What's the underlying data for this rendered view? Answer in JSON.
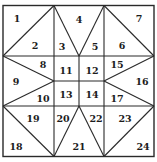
{
  "diagram": {
    "colors": {
      "line": "#2a2a2a",
      "text": "#1c1c1c",
      "background": "#ffffff"
    },
    "pieces": [
      {
        "id": "1",
        "x": 17,
        "y": 18
      },
      {
        "id": "2",
        "x": 35,
        "y": 45
      },
      {
        "id": "3",
        "x": 62,
        "y": 46
      },
      {
        "id": "4",
        "x": 79,
        "y": 19
      },
      {
        "id": "5",
        "x": 95,
        "y": 46
      },
      {
        "id": "6",
        "x": 122,
        "y": 45
      },
      {
        "id": "7",
        "x": 139,
        "y": 18
      },
      {
        "id": "8",
        "x": 43,
        "y": 64
      },
      {
        "id": "9",
        "x": 16,
        "y": 81
      },
      {
        "id": "10",
        "x": 43,
        "y": 98
      },
      {
        "id": "11",
        "x": 66,
        "y": 70
      },
      {
        "id": "12",
        "x": 92,
        "y": 70
      },
      {
        "id": "13",
        "x": 66,
        "y": 94
      },
      {
        "id": "14",
        "x": 92,
        "y": 94
      },
      {
        "id": "15",
        "x": 117,
        "y": 64
      },
      {
        "id": "16",
        "x": 142,
        "y": 81
      },
      {
        "id": "17",
        "x": 117,
        "y": 98
      },
      {
        "id": "18",
        "x": 16,
        "y": 146
      },
      {
        "id": "19",
        "x": 33,
        "y": 118
      },
      {
        "id": "20",
        "x": 63,
        "y": 118
      },
      {
        "id": "21",
        "x": 79,
        "y": 146
      },
      {
        "id": "22",
        "x": 96,
        "y": 118
      },
      {
        "id": "23",
        "x": 125,
        "y": 118
      },
      {
        "id": "24",
        "x": 143,
        "y": 146
      }
    ]
  }
}
